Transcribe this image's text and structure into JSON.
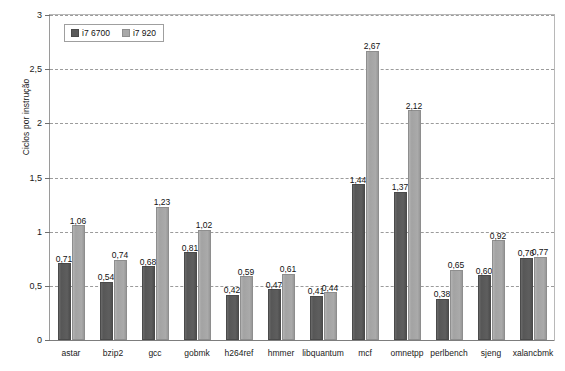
{
  "chart_data": {
    "type": "bar",
    "title": "",
    "xlabel": "",
    "ylabel": "Ciclos por instrução",
    "ylim": [
      0,
      3
    ],
    "ytick_labels": [
      "0",
      "0,5",
      "1",
      "1,5",
      "2",
      "2,5",
      "3"
    ],
    "ytick_values": [
      0,
      0.5,
      1,
      1.5,
      2,
      2.5,
      3
    ],
    "grid": true,
    "legend_position": "top-left",
    "categories": [
      "astar",
      "bzip2",
      "gcc",
      "gobmk",
      "h264ref",
      "hmmer",
      "libquantum",
      "mcf",
      "omnetpp",
      "perlbench",
      "sjeng",
      "xalancbmk"
    ],
    "series": [
      {
        "name": "i7 6700",
        "color": "#5a5a5a",
        "values": [
          0.71,
          0.54,
          0.68,
          0.81,
          0.42,
          0.47,
          0.41,
          1.44,
          1.37,
          0.38,
          0.6,
          0.76
        ],
        "labels": [
          "0,71",
          "0,54",
          "0,68",
          "0,81",
          "0,42",
          "0,47",
          "0,41",
          "1,44",
          "1,37",
          "0,38",
          "0,60",
          "0,76"
        ]
      },
      {
        "name": "i7 920",
        "color": "#a8a8a8",
        "values": [
          1.06,
          0.74,
          1.23,
          1.02,
          0.59,
          0.61,
          0.44,
          2.67,
          2.12,
          0.65,
          0.92,
          0.77
        ],
        "labels": [
          "1,06",
          "0,74",
          "1,23",
          "1,02",
          "0,59",
          "0,61",
          "0,44",
          "2,67",
          "2,12",
          "0,65",
          "0,92",
          "0,77"
        ]
      }
    ]
  }
}
